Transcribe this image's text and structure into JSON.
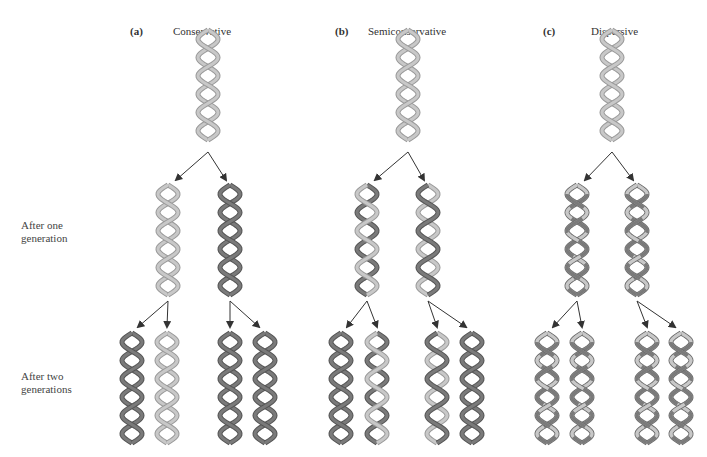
{
  "panels": [
    {
      "letter": "(a)",
      "title": "Conservative"
    },
    {
      "letter": "(b)",
      "title": "Semiconservative"
    },
    {
      "letter": "(c)",
      "title": "Dispersive"
    }
  ],
  "row_labels": {
    "gen1_line1": "After one",
    "gen1_line2": "generation",
    "gen2_line1": "After two",
    "gen2_line2": "generations"
  },
  "colors": {
    "light_strand": "#c8c8c8",
    "light_edge": "#9a9a9a",
    "dark_strand": "#7a7a7a",
    "dark_edge": "#555555",
    "arrow": "#333333"
  },
  "helices": {
    "parent": [
      {
        "panel": "a",
        "x": 208,
        "y": 30,
        "strands": [
          "L",
          "L"
        ]
      },
      {
        "panel": "b",
        "x": 408,
        "y": 30,
        "strands": [
          "L",
          "L"
        ]
      },
      {
        "panel": "c",
        "x": 612,
        "y": 30,
        "strands": [
          "L",
          "L"
        ]
      }
    ],
    "gen1": [
      {
        "panel": "a",
        "x": 168,
        "y": 185,
        "strands": [
          "L",
          "L"
        ]
      },
      {
        "panel": "a",
        "x": 230,
        "y": 185,
        "strands": [
          "D",
          "D"
        ]
      },
      {
        "panel": "b",
        "x": 367,
        "y": 185,
        "strands": [
          "D",
          "L"
        ]
      },
      {
        "panel": "b",
        "x": 428,
        "y": 185,
        "strands": [
          "L",
          "D"
        ]
      },
      {
        "panel": "c",
        "x": 577,
        "y": 185,
        "strands": [
          "M",
          "M"
        ]
      },
      {
        "panel": "c",
        "x": 637,
        "y": 185,
        "strands": [
          "M",
          "M"
        ]
      }
    ],
    "gen2": [
      {
        "panel": "a",
        "x": 132,
        "y": 333,
        "strands": [
          "D",
          "D"
        ]
      },
      {
        "panel": "a",
        "x": 167,
        "y": 333,
        "strands": [
          "L",
          "L"
        ]
      },
      {
        "panel": "a",
        "x": 230,
        "y": 333,
        "strands": [
          "D",
          "D"
        ]
      },
      {
        "panel": "a",
        "x": 265,
        "y": 333,
        "strands": [
          "D",
          "D"
        ]
      },
      {
        "panel": "b",
        "x": 341,
        "y": 333,
        "strands": [
          "D",
          "D"
        ]
      },
      {
        "panel": "b",
        "x": 377,
        "y": 333,
        "strands": [
          "D",
          "L"
        ]
      },
      {
        "panel": "b",
        "x": 437,
        "y": 333,
        "strands": [
          "L",
          "D"
        ]
      },
      {
        "panel": "b",
        "x": 472,
        "y": 333,
        "strands": [
          "D",
          "D"
        ]
      },
      {
        "panel": "c",
        "x": 547,
        "y": 333,
        "strands": [
          "M",
          "M"
        ]
      },
      {
        "panel": "c",
        "x": 582,
        "y": 333,
        "strands": [
          "M",
          "M"
        ]
      },
      {
        "panel": "c",
        "x": 647,
        "y": 333,
        "strands": [
          "M",
          "M"
        ]
      },
      {
        "panel": "c",
        "x": 681,
        "y": 333,
        "strands": [
          "M",
          "M"
        ]
      }
    ]
  }
}
